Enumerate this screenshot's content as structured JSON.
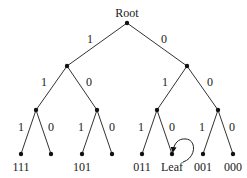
{
  "diagram": {
    "root_label": "Root",
    "nodes": [
      {
        "id": "r",
        "x": 127,
        "y": 23
      },
      {
        "id": "n1",
        "x": 67,
        "y": 66
      },
      {
        "id": "n0",
        "x": 187,
        "y": 66
      },
      {
        "id": "n11",
        "x": 36,
        "y": 110
      },
      {
        "id": "n10",
        "x": 97,
        "y": 110
      },
      {
        "id": "n01",
        "x": 157,
        "y": 110
      },
      {
        "id": "n00",
        "x": 218,
        "y": 110
      },
      {
        "id": "l111",
        "x": 21,
        "y": 154
      },
      {
        "id": "l110",
        "x": 51,
        "y": 154
      },
      {
        "id": "l101",
        "x": 82,
        "y": 154
      },
      {
        "id": "l100",
        "x": 112,
        "y": 154
      },
      {
        "id": "l011",
        "x": 142,
        "y": 154
      },
      {
        "id": "l010",
        "x": 172,
        "y": 154
      },
      {
        "id": "l001",
        "x": 203,
        "y": 154
      },
      {
        "id": "l000",
        "x": 233,
        "y": 154
      }
    ],
    "edges": [
      {
        "from": "r",
        "to": "n1",
        "label": "1",
        "lx": 90,
        "ly": 43
      },
      {
        "from": "r",
        "to": "n0",
        "label": "0",
        "lx": 164,
        "ly": 43
      },
      {
        "from": "n1",
        "to": "n11",
        "label": "1",
        "lx": 44,
        "ly": 86
      },
      {
        "from": "n1",
        "to": "n10",
        "label": "0",
        "lx": 89,
        "ly": 86
      },
      {
        "from": "n0",
        "to": "n01",
        "label": "1",
        "lx": 165,
        "ly": 86
      },
      {
        "from": "n0",
        "to": "n00",
        "label": "0",
        "lx": 210,
        "ly": 86
      },
      {
        "from": "n11",
        "to": "l111",
        "label": "1",
        "lx": 21,
        "ly": 131
      },
      {
        "from": "n11",
        "to": "l110",
        "label": "0",
        "lx": 51,
        "ly": 131
      },
      {
        "from": "n10",
        "to": "l101",
        "label": "1",
        "lx": 81,
        "ly": 131
      },
      {
        "from": "n10",
        "to": "l100",
        "label": "0",
        "lx": 112,
        "ly": 131
      },
      {
        "from": "n01",
        "to": "l011",
        "label": "1",
        "lx": 141,
        "ly": 131
      },
      {
        "from": "n01",
        "to": "l010",
        "label": "0",
        "lx": 172,
        "ly": 131
      },
      {
        "from": "n00",
        "to": "l001",
        "label": "1",
        "lx": 202,
        "ly": 131
      },
      {
        "from": "n00",
        "to": "l000",
        "label": "0",
        "lx": 232,
        "ly": 131
      }
    ],
    "leaf_labels": [
      {
        "text": "111",
        "x": 21,
        "y": 171
      },
      {
        "text": "101",
        "x": 82,
        "y": 171
      },
      {
        "text": "011",
        "x": 142,
        "y": 171
      },
      {
        "text": "Leaf",
        "x": 172,
        "y": 171
      },
      {
        "text": "001",
        "x": 203,
        "y": 171
      },
      {
        "text": "000",
        "x": 233,
        "y": 171
      }
    ],
    "line_color": "#333333",
    "node_color": "#111111"
  }
}
